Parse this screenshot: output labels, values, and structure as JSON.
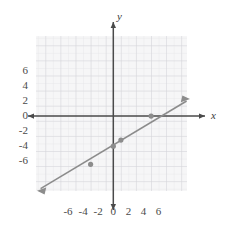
{
  "chart_data": {
    "type": "line",
    "title": "",
    "xlabel": "x",
    "ylabel": "y",
    "xlim": [
      -7.7,
      7.9
    ],
    "ylim": [
      -7.2,
      7.2
    ],
    "grid": true,
    "grid_step": 0.5,
    "legend": "none",
    "x_ticks": [
      "-6",
      "-4",
      "-2",
      "0",
      "2",
      "4",
      "6"
    ],
    "x_tick_values": [
      -6,
      -4,
      -2,
      0,
      2,
      4,
      6
    ],
    "y_ticks": [
      "6",
      "4",
      "2",
      "0",
      "-2",
      "-4",
      "-6"
    ],
    "y_tick_values": [
      6,
      4,
      2,
      0,
      -2,
      -4,
      -6
    ],
    "series": [
      {
        "name": "line",
        "equation": "y = 0.4x - 2",
        "slope": 0.4,
        "intercept": -2,
        "x": [
          -7,
          -3,
          0,
          1,
          5,
          7.5
        ],
        "y": [
          -4.8,
          -3.2,
          -2,
          -1.6,
          0,
          1
        ],
        "marked_points": [
          {
            "x": -3,
            "y": -3.2
          },
          {
            "x": 0,
            "y": -2
          },
          {
            "x": 1,
            "y": -1.6
          },
          {
            "x": 5,
            "y": 0
          }
        ],
        "start_arrow": true,
        "end_arrow": true,
        "color": "#8c8c8c"
      }
    ]
  },
  "colors": {
    "background": "#ffffff",
    "grid_minor": "#e3e3e6",
    "grid_major": "#d2d2d6",
    "grid_field": "#f4f4f5",
    "axis": "#4a4a4a",
    "line": "#8c8c8c",
    "marker": "#8c8c8c",
    "tick_text": "#4a4a4a"
  },
  "axis_labels": {
    "x": "x",
    "y": "y"
  }
}
